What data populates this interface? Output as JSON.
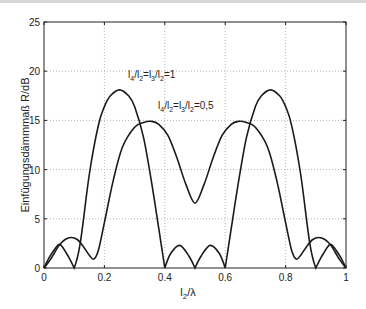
{
  "chart_data": {
    "type": "line",
    "title": "",
    "xlabel": "l_2/λ",
    "ylabel": "Einfügungsdämmmaß R/dB",
    "xlim": [
      0,
      1
    ],
    "ylim": [
      0,
      25
    ],
    "xticks": [
      "0",
      "0.2",
      "0.4",
      "0.6",
      "0.8",
      "1"
    ],
    "yticks": [
      "0",
      "5",
      "10",
      "15",
      "20",
      "25"
    ],
    "grid": true,
    "series": [
      {
        "name": "l4/l2=l3/l2=1",
        "annotation": "l₄/l₂=l₃/l₂=1",
        "x": [
          0,
          0.02,
          0.04,
          0.05,
          0.06,
          0.08,
          0.1,
          0.12,
          0.15,
          0.18,
          0.2,
          0.22,
          0.25,
          0.28,
          0.3,
          0.33,
          0.36,
          0.38,
          0.4,
          0.42,
          0.45,
          0.48,
          0.5,
          0.52,
          0.55,
          0.58,
          0.6,
          0.62,
          0.64,
          0.67,
          0.7,
          0.72,
          0.75,
          0.78,
          0.8,
          0.82,
          0.85,
          0.88,
          0.9,
          0.92,
          0.94,
          0.95,
          0.96,
          0.98,
          1
        ],
        "y": [
          0,
          1.2,
          2.1,
          2.4,
          2.2,
          1.2,
          0,
          2.5,
          9.5,
          14.5,
          16.4,
          17.5,
          18.1,
          17.5,
          16.4,
          13.2,
          8,
          4,
          0,
          1.5,
          2.3,
          1.2,
          0,
          1.2,
          2.3,
          1.5,
          0,
          4,
          8,
          13.2,
          16.4,
          17.5,
          18.1,
          17.5,
          16.4,
          14.5,
          9.5,
          2.5,
          0,
          1.2,
          2.2,
          2.4,
          2.1,
          1.2,
          0
        ]
      },
      {
        "name": "l4/l2=l3/l2=0,5",
        "annotation": "l₄/l₂=l₃/l₂=0,5",
        "x": [
          0,
          0.02,
          0.05,
          0.07,
          0.09,
          0.11,
          0.13,
          0.15,
          0.165,
          0.18,
          0.2,
          0.23,
          0.26,
          0.3,
          0.33,
          0.357,
          0.38,
          0.41,
          0.44,
          0.47,
          0.5,
          0.53,
          0.56,
          0.59,
          0.62,
          0.643,
          0.67,
          0.7,
          0.74,
          0.77,
          0.8,
          0.82,
          0.835,
          0.85,
          0.87,
          0.89,
          0.91,
          0.93,
          0.95,
          0.98,
          1
        ],
        "y": [
          0,
          0.8,
          2.3,
          2.9,
          3.1,
          2.9,
          2.2,
          1.3,
          0.9,
          1.8,
          4.6,
          9,
          12.3,
          14.3,
          14.8,
          14.9,
          14.6,
          13.5,
          11.2,
          8.5,
          6.6,
          8.5,
          11.2,
          13.5,
          14.6,
          14.9,
          14.8,
          14.3,
          12.3,
          9,
          4.6,
          1.8,
          0.9,
          1.3,
          2.2,
          2.9,
          3.1,
          2.9,
          2.3,
          0.8,
          0
        ]
      }
    ]
  },
  "annotations": {
    "a1": {
      "base": "l",
      "s1": "4",
      "slash1": "/l",
      "s2": "2",
      "eq": "=l",
      "s3": "3",
      "slash2": "/l",
      "s4": "2",
      "val": "=1"
    },
    "a2": {
      "base": "l",
      "s1": "4",
      "slash1": "/l",
      "s2": "2",
      "eq": "=l",
      "s3": "3",
      "slash2": "/l",
      "s4": "2",
      "val": "=0,5"
    }
  },
  "axis_labels": {
    "x_base": "l",
    "x_sub": "2",
    "x_rest": "/λ",
    "y": "Einfügungsdämmmaß R/dB"
  }
}
